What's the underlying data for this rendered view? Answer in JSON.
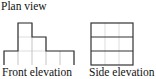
{
  "labels": {
    "plan": "Plan view",
    "front": "Front elevation",
    "side": "Side elevation"
  },
  "colors": {
    "outline": "#333333",
    "grid": "#c8c8c8",
    "background": "#ffffff"
  },
  "front_elevation": {
    "cell_size": 14,
    "origin_x": 4,
    "base_y": 65,
    "column_heights": [
      1,
      3,
      2,
      1,
      1
    ]
  },
  "side_elevation": {
    "cell_size": 14,
    "origin_x": 91,
    "base_y": 65,
    "columns": 3,
    "rows": 3
  }
}
